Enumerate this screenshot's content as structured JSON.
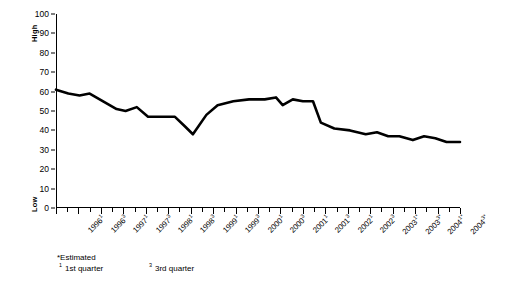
{
  "axis": {
    "high_label": "High",
    "low_label": "Low",
    "yticks": [
      0,
      10,
      20,
      30,
      40,
      50,
      60,
      70,
      80,
      90,
      100
    ]
  },
  "footnotes": {
    "estimated": "*Estimated",
    "q1_marker": "1",
    "q1_text": "1st quarter",
    "q3_marker": "3",
    "q3_text": "3rd quarter"
  },
  "colors": {
    "line": "#000000",
    "axis": "#000000",
    "background": "#ffffff"
  },
  "chart_data": {
    "type": "line",
    "title": "",
    "xlabel": "",
    "ylabel": "",
    "ylim": [
      0,
      100
    ],
    "grid": false,
    "legend": "none",
    "categories": [
      "1996¹",
      "1996³",
      "1997¹",
      "1997³",
      "1998¹",
      "1998³",
      "1999¹",
      "1999³",
      "2000¹",
      "2000³",
      "2001¹",
      "2001³",
      "2002¹",
      "2002³",
      "2003¹*",
      "2003³*",
      "2004¹*",
      "2004³*"
    ],
    "category_years": [
      "1996",
      "1996",
      "1997",
      "1997",
      "1998",
      "1998",
      "1999",
      "1999",
      "2000",
      "2000",
      "2001",
      "2001",
      "2002",
      "2002",
      "2003",
      "2003",
      "2004",
      "2004"
    ],
    "category_quarters": [
      "1",
      "3",
      "1",
      "3",
      "1",
      "3",
      "1",
      "3",
      "1",
      "3",
      "1",
      "3",
      "1",
      "3",
      "1",
      "3",
      "1",
      "3"
    ],
    "category_estimated": [
      false,
      false,
      false,
      false,
      false,
      false,
      false,
      false,
      false,
      false,
      false,
      false,
      false,
      false,
      true,
      true,
      true,
      true
    ],
    "series": [
      {
        "name": "Index",
        "values": [
          61,
          59,
          58,
          59,
          54,
          50,
          52,
          47,
          46,
          38,
          48,
          54,
          56,
          57,
          56,
          53,
          55,
          40
        ]
      }
    ],
    "points": [
      {
        "x": 0.0,
        "y": 61
      },
      {
        "x": 0.55,
        "y": 59
      },
      {
        "x": 1.05,
        "y": 58
      },
      {
        "x": 1.5,
        "y": 59
      },
      {
        "x": 2.1,
        "y": 55
      },
      {
        "x": 2.7,
        "y": 51
      },
      {
        "x": 3.1,
        "y": 50
      },
      {
        "x": 3.6,
        "y": 52
      },
      {
        "x": 4.1,
        "y": 47
      },
      {
        "x": 4.7,
        "y": 47
      },
      {
        "x": 5.3,
        "y": 47
      },
      {
        "x": 5.75,
        "y": 42
      },
      {
        "x": 6.1,
        "y": 38
      },
      {
        "x": 6.7,
        "y": 48
      },
      {
        "x": 7.2,
        "y": 53
      },
      {
        "x": 7.9,
        "y": 55
      },
      {
        "x": 8.6,
        "y": 56
      },
      {
        "x": 9.3,
        "y": 56
      },
      {
        "x": 9.8,
        "y": 57
      },
      {
        "x": 10.1,
        "y": 53
      },
      {
        "x": 10.55,
        "y": 56
      },
      {
        "x": 11.0,
        "y": 55
      },
      {
        "x": 11.45,
        "y": 55
      },
      {
        "x": 11.8,
        "y": 44
      },
      {
        "x": 12.4,
        "y": 41
      },
      {
        "x": 13.1,
        "y": 40
      },
      {
        "x": 13.8,
        "y": 38
      },
      {
        "x": 14.3,
        "y": 39
      },
      {
        "x": 14.8,
        "y": 37
      },
      {
        "x": 15.3,
        "y": 37
      },
      {
        "x": 15.9,
        "y": 35
      },
      {
        "x": 16.4,
        "y": 37
      },
      {
        "x": 16.9,
        "y": 36
      },
      {
        "x": 17.4,
        "y": 34
      },
      {
        "x": 18.0,
        "y": 34
      }
    ]
  }
}
